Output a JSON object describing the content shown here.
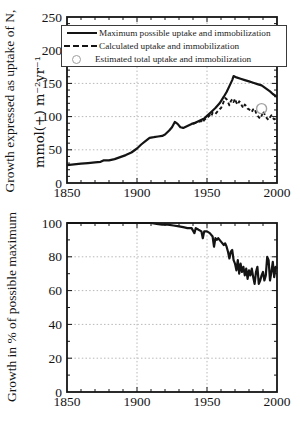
{
  "colors": {
    "line": "#141414",
    "grid": "#b8b8b8",
    "marker_gray": "#a3a3a3",
    "text": "#141414",
    "background": "#ffffff",
    "legend_border": "#3a3a3a"
  },
  "chart_data": [
    {
      "type": "line",
      "title": "",
      "ylabel_line1": "Growth expressed as uptake of N,",
      "ylabel_line2": "mmol(+) m⁻²yr⁻¹",
      "xlabel": "",
      "xlim": [
        1850,
        2000
      ],
      "ylim": [
        0,
        250
      ],
      "xticks": [
        1850,
        1900,
        1950,
        2000
      ],
      "yticks": [
        0,
        50,
        100,
        150,
        200,
        250
      ],
      "minor_tick_step_x": 10,
      "minor_tick_step_y": 10,
      "gridlines": {
        "x": [
          1900,
          1950
        ],
        "y": [
          50,
          100,
          150,
          200
        ]
      },
      "legend_position": "top",
      "legend": [
        {
          "label": "Maximum possible uptake and immobilization",
          "sample": "solid-line"
        },
        {
          "label": "Calculated uptake and immobilization",
          "sample": "dashed-line"
        },
        {
          "label": "Estimated total uptake and immobilization",
          "sample": "gray-circle"
        }
      ],
      "series": [
        {
          "name": "Maximum possible uptake and immobilization",
          "style": "solid",
          "points": [
            [
              1850,
              27
            ],
            [
              1855,
              28
            ],
            [
              1860,
              29
            ],
            [
              1865,
              30
            ],
            [
              1870,
              31
            ],
            [
              1874,
              32
            ],
            [
              1876,
              34
            ],
            [
              1880,
              34
            ],
            [
              1884,
              36
            ],
            [
              1888,
              39
            ],
            [
              1892,
              42
            ],
            [
              1896,
              46
            ],
            [
              1900,
              52
            ],
            [
              1903,
              58
            ],
            [
              1906,
              63
            ],
            [
              1909,
              68
            ],
            [
              1912,
              69
            ],
            [
              1915,
              70
            ],
            [
              1918,
              71
            ],
            [
              1920,
              73
            ],
            [
              1923,
              79
            ],
            [
              1925,
              84
            ],
            [
              1927,
              92
            ],
            [
              1929,
              89
            ],
            [
              1931,
              84
            ],
            [
              1933,
              83
            ],
            [
              1936,
              86
            ],
            [
              1939,
              89
            ],
            [
              1942,
              91
            ],
            [
              1945,
              94
            ],
            [
              1948,
              97
            ],
            [
              1950,
              101
            ],
            [
              1953,
              107
            ],
            [
              1956,
              113
            ],
            [
              1959,
              120
            ],
            [
              1962,
              130
            ],
            [
              1964,
              137
            ],
            [
              1966,
              146
            ],
            [
              1968,
              155
            ],
            [
              1969,
              161
            ],
            [
              1971,
              159
            ],
            [
              1974,
              157
            ],
            [
              1977,
              155
            ],
            [
              1980,
              153
            ],
            [
              1983,
              151
            ],
            [
              1986,
              149
            ],
            [
              1989,
              147
            ],
            [
              1991,
              144
            ],
            [
              1993,
              141
            ],
            [
              1995,
              138
            ],
            [
              1997,
              134
            ],
            [
              2000,
              130
            ]
          ]
        },
        {
          "name": "Calculated uptake and immobilization",
          "style": "dashed",
          "points": [
            [
              1940,
              89
            ],
            [
              1942,
              91
            ],
            [
              1944,
              92
            ],
            [
              1946,
              93
            ],
            [
              1947,
              91
            ],
            [
              1948,
              95
            ],
            [
              1950,
              98
            ],
            [
              1952,
              102
            ],
            [
              1953,
              100
            ],
            [
              1954,
              106
            ],
            [
              1956,
              104
            ],
            [
              1958,
              109
            ],
            [
              1960,
              113
            ],
            [
              1961,
              117
            ],
            [
              1962,
              123
            ],
            [
              1963,
              128
            ],
            [
              1964,
              126
            ],
            [
              1965,
              122
            ],
            [
              1966,
              117
            ],
            [
              1967,
              123
            ],
            [
              1968,
              126
            ],
            [
              1969,
              122
            ],
            [
              1970,
              127
            ],
            [
              1971,
              121
            ],
            [
              1972,
              118
            ],
            [
              1973,
              123
            ],
            [
              1974,
              121
            ],
            [
              1975,
              116
            ],
            [
              1976,
              113
            ],
            [
              1977,
              118
            ],
            [
              1978,
              116
            ],
            [
              1979,
              112
            ],
            [
              1980,
              111
            ],
            [
              1981,
              109
            ],
            [
              1982,
              107
            ],
            [
              1983,
              111
            ],
            [
              1984,
              112
            ],
            [
              1985,
              106
            ],
            [
              1986,
              102
            ],
            [
              1987,
              99
            ],
            [
              1988,
              97
            ],
            [
              1989,
              101
            ],
            [
              1990,
              108
            ],
            [
              1991,
              104
            ],
            [
              1992,
              100
            ],
            [
              1993,
              97
            ],
            [
              1994,
              95
            ],
            [
              1995,
              99
            ],
            [
              1996,
              102
            ],
            [
              1997,
              98
            ],
            [
              1998,
              96
            ],
            [
              1999,
              97
            ],
            [
              2000,
              98
            ]
          ]
        },
        {
          "name": "Estimated total uptake and immobilization",
          "style": "circle-marker",
          "points": [
            [
              1989,
              112
            ]
          ]
        }
      ]
    },
    {
      "type": "line",
      "title": "",
      "ylabel": "Growth in % of possible maximum",
      "xlabel": "",
      "xlim": [
        1850,
        2000
      ],
      "ylim": [
        0,
        100
      ],
      "xticks": [
        1850,
        1900,
        1950,
        2000
      ],
      "yticks": [
        0,
        20,
        40,
        60,
        80,
        100
      ],
      "minor_tick_step_x": 10,
      "minor_tick_step_y": 10,
      "gridlines": {
        "x": [
          1900,
          1950
        ],
        "y": [
          20,
          40,
          60,
          80
        ]
      },
      "series": [
        {
          "name": "Growth in % of possible maximum",
          "style": "solid",
          "points": [
            [
              1850,
              100
            ],
            [
              1860,
              100
            ],
            [
              1870,
              100
            ],
            [
              1880,
              100
            ],
            [
              1890,
              100
            ],
            [
              1900,
              100
            ],
            [
              1905,
              100
            ],
            [
              1910,
              100
            ],
            [
              1914,
              99.5
            ],
            [
              1918,
              99
            ],
            [
              1922,
              99
            ],
            [
              1926,
              98.5
            ],
            [
              1930,
              98
            ],
            [
              1933,
              97.5
            ],
            [
              1936,
              97
            ],
            [
              1939,
              97
            ],
            [
              1941,
              94
            ],
            [
              1942,
              97
            ],
            [
              1944,
              96
            ],
            [
              1946,
              95
            ],
            [
              1947,
              91
            ],
            [
              1948,
              95
            ],
            [
              1950,
              95
            ],
            [
              1952,
              94
            ],
            [
              1954,
              92
            ],
            [
              1955,
              86
            ],
            [
              1956,
              91
            ],
            [
              1957,
              90
            ],
            [
              1958,
              91
            ],
            [
              1960,
              89
            ],
            [
              1962,
              87
            ],
            [
              1963,
              88
            ],
            [
              1964,
              86
            ],
            [
              1965,
              83
            ],
            [
              1966,
              79
            ],
            [
              1967,
              83
            ],
            [
              1968,
              84
            ],
            [
              1969,
              78
            ],
            [
              1970,
              76
            ],
            [
              1971,
              72
            ],
            [
              1972,
              78
            ],
            [
              1973,
              70
            ],
            [
              1974,
              76
            ],
            [
              1975,
              71
            ],
            [
              1976,
              74
            ],
            [
              1977,
              69
            ],
            [
              1978,
              73
            ],
            [
              1979,
              67
            ],
            [
              1980,
              72
            ],
            [
              1981,
              69
            ],
            [
              1982,
              73
            ],
            [
              1983,
              68
            ],
            [
              1984,
              64
            ],
            [
              1985,
              71
            ],
            [
              1986,
              74
            ],
            [
              1987,
              64
            ],
            [
              1988,
              66
            ],
            [
              1989,
              69
            ],
            [
              1990,
              71
            ],
            [
              1991,
              66
            ],
            [
              1992,
              69
            ],
            [
              1993,
              80
            ],
            [
              1994,
              78
            ],
            [
              1995,
              66
            ],
            [
              1996,
              71
            ],
            [
              1997,
              77
            ],
            [
              1998,
              68
            ],
            [
              1999,
              74
            ],
            [
              2000,
              73
            ]
          ]
        }
      ]
    }
  ]
}
